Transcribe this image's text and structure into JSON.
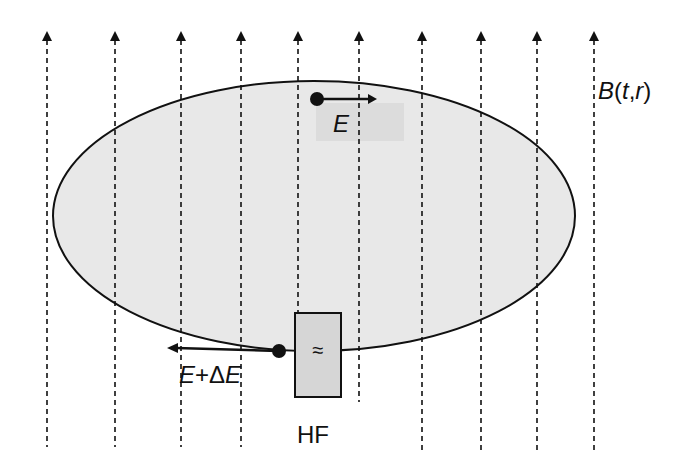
{
  "field_label": "B(t,r)",
  "field_label_parts": {
    "b": "B",
    "open": "(",
    "t": "t",
    "comma": ",",
    "r": "r",
    "close": ")"
  },
  "top_particle": {
    "label": "E",
    "direction": "right"
  },
  "bottom_particle": {
    "label_e1": "E",
    "label_plus": "+",
    "label_delta": "Δ",
    "label_e2": "E",
    "direction": "left"
  },
  "hf_cavity": {
    "label": "HF",
    "symbol": "≈"
  },
  "field_lines_count": 10,
  "colors": {
    "orbit_fill": "#e8e8e8",
    "stroke": "#111111",
    "cavity_fill": "#d6d6d6",
    "label_bg": "#dedede"
  }
}
